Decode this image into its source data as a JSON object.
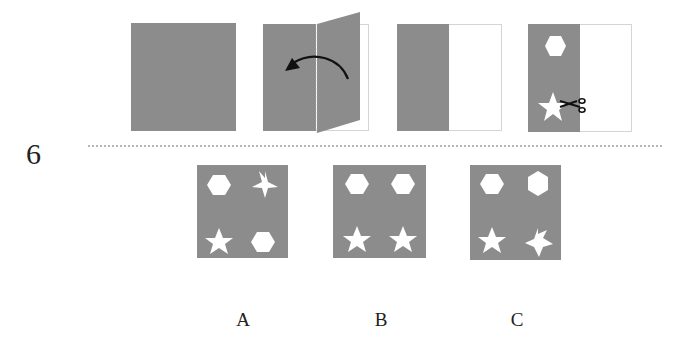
{
  "question": {
    "number": "6",
    "description": "Paper folding and cutting puzzle: a square sheet is folded in half (right onto left), shapes are cut, then unfolded. Choose the resulting pattern."
  },
  "steps": [
    {
      "name": "full-square-sheet",
      "state": "unfolded gray square"
    },
    {
      "name": "folding-sheet",
      "state": "right half folding over to left",
      "icon": "curved-arrow-left-icon"
    },
    {
      "name": "folded-sheet",
      "state": "folded in half; right half outlined empty"
    },
    {
      "name": "cut-sheet",
      "state": "hexagon and star cut from folded sheet",
      "shapes": [
        "hexagon",
        "star"
      ],
      "icon": "scissors-icon"
    }
  ],
  "options": [
    {
      "label": "A",
      "shapes": [
        "hexagon",
        "star-rotated",
        "star",
        "hexagon"
      ]
    },
    {
      "label": "B",
      "shapes": [
        "hexagon",
        "hexagon",
        "star",
        "star"
      ]
    },
    {
      "label": "C",
      "shapes": [
        "hexagon",
        "hexagon-rotated",
        "star",
        "star-rotated"
      ]
    }
  ],
  "colors": {
    "sheet": "#8c8c8c",
    "cutout": "#ffffff",
    "outline": "#d4d4d4",
    "text": "#222222"
  }
}
